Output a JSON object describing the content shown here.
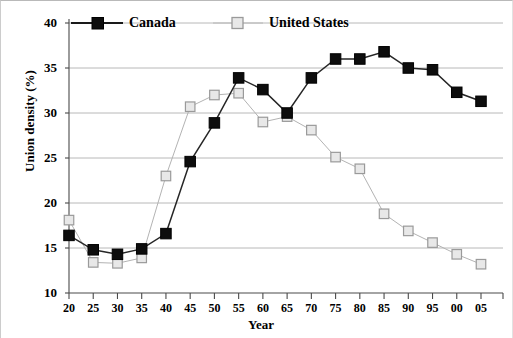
{
  "chart_data": {
    "type": "line",
    "title": "",
    "xlabel": "Year",
    "ylabel": "Union density (%)",
    "x": [
      "20",
      "25",
      "30",
      "35",
      "40",
      "45",
      "50",
      "55",
      "60",
      "65",
      "70",
      "75",
      "80",
      "85",
      "90",
      "95",
      "00",
      "05"
    ],
    "xlim": [
      1920,
      2005
    ],
    "ylim": [
      10,
      40
    ],
    "ytick_labels": [
      "40",
      "35",
      "30",
      "25",
      "20",
      "15",
      "10"
    ],
    "ytick_values": [
      40,
      35,
      30,
      25,
      20,
      15,
      10
    ],
    "grid": "horizontal",
    "legend_position": "top",
    "series": [
      {
        "name": "Canada",
        "color": "#000000",
        "marker": "filled-square",
        "values": [
          16.4,
          14.8,
          14.3,
          14.9,
          16.6,
          24.6,
          28.9,
          33.9,
          32.6,
          30.0,
          33.9,
          36.0,
          36.0,
          36.8,
          35.0,
          34.8,
          32.3,
          31.3
        ]
      },
      {
        "name": "United States",
        "color": "#a8a8a8",
        "marker": "open-square",
        "values": [
          18.1,
          13.4,
          13.3,
          13.9,
          23.0,
          30.7,
          32.0,
          32.2,
          29.0,
          29.6,
          28.1,
          25.1,
          23.8,
          18.8,
          16.9,
          15.6,
          14.3,
          13.2
        ]
      }
    ]
  },
  "legend": {
    "canada_label": "Canada",
    "us_label": "United States"
  },
  "axes": {
    "x_label": "Year",
    "y_label": "Union density (%)"
  }
}
